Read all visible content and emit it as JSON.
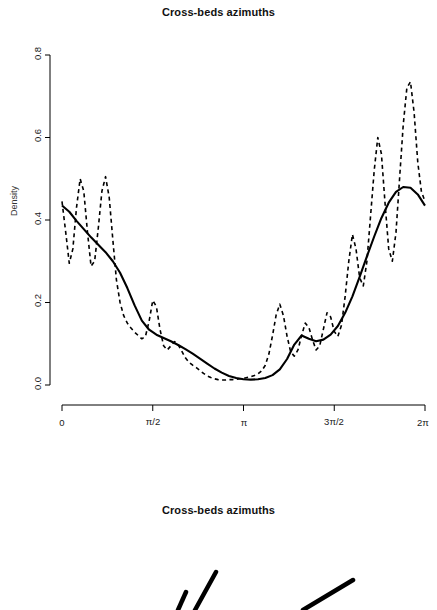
{
  "panels": [
    {
      "title": "Cross-beds azimuths"
    },
    {
      "title": "Cross-beds azimuths"
    }
  ],
  "chart_data": {
    "type": "line",
    "title": "Cross-beds azimuths",
    "xlabel": "",
    "ylabel": "Density",
    "xlim": [
      0,
      6.283185307179586
    ],
    "ylim": [
      0,
      0.8
    ],
    "grid": false,
    "legend": "none",
    "xticks": [
      0,
      1.5707963,
      3.1415927,
      4.712389,
      6.2831853
    ],
    "xticklabels": [
      "0",
      "π/2",
      "π",
      "3π/2",
      "2π"
    ],
    "yticks": [
      0.0,
      0.2,
      0.4,
      0.6,
      0.8
    ],
    "yticklabels": [
      "0.0",
      "0.2",
      "0.4",
      "0.6",
      "0.8"
    ],
    "series": [
      {
        "name": "smooth-density",
        "style": "solid",
        "color": "#000000",
        "x": [
          0.0,
          0.126,
          0.251,
          0.377,
          0.503,
          0.628,
          0.754,
          0.88,
          1.005,
          1.131,
          1.257,
          1.382,
          1.508,
          1.634,
          1.759,
          1.885,
          2.011,
          2.136,
          2.262,
          2.388,
          2.513,
          2.639,
          2.765,
          2.89,
          3.016,
          3.142,
          3.267,
          3.393,
          3.519,
          3.644,
          3.77,
          3.896,
          4.021,
          4.147,
          4.273,
          4.398,
          4.524,
          4.65,
          4.775,
          4.901,
          5.027,
          5.152,
          5.278,
          5.404,
          5.529,
          5.655,
          5.781,
          5.906,
          6.032,
          6.158,
          6.283
        ],
        "y": [
          0.435,
          0.42,
          0.398,
          0.378,
          0.358,
          0.34,
          0.322,
          0.3,
          0.272,
          0.235,
          0.193,
          0.156,
          0.134,
          0.122,
          0.114,
          0.106,
          0.097,
          0.087,
          0.076,
          0.064,
          0.052,
          0.04,
          0.03,
          0.022,
          0.017,
          0.014,
          0.013,
          0.014,
          0.017,
          0.024,
          0.038,
          0.063,
          0.098,
          0.12,
          0.112,
          0.106,
          0.11,
          0.122,
          0.143,
          0.175,
          0.215,
          0.262,
          0.312,
          0.36,
          0.405,
          0.442,
          0.468,
          0.48,
          0.478,
          0.462,
          0.435
        ]
      },
      {
        "name": "kernel-density-oscillating",
        "style": "dashed",
        "color": "#000000",
        "x": [
          0.0,
          0.063,
          0.126,
          0.188,
          0.251,
          0.314,
          0.377,
          0.44,
          0.503,
          0.565,
          0.628,
          0.691,
          0.754,
          0.817,
          0.88,
          0.942,
          1.005,
          1.068,
          1.131,
          1.194,
          1.257,
          1.319,
          1.382,
          1.445,
          1.508,
          1.571,
          1.634,
          1.696,
          1.759,
          1.822,
          1.885,
          1.948,
          2.011,
          2.073,
          2.136,
          2.199,
          2.262,
          2.325,
          2.388,
          2.45,
          2.513,
          2.576,
          2.639,
          2.702,
          2.765,
          2.827,
          2.89,
          2.953,
          3.016,
          3.079,
          3.142,
          3.204,
          3.267,
          3.33,
          3.393,
          3.456,
          3.519,
          3.581,
          3.644,
          3.707,
          3.77,
          3.833,
          3.896,
          3.958,
          4.021,
          4.084,
          4.147,
          4.21,
          4.273,
          4.335,
          4.398,
          4.461,
          4.524,
          4.587,
          4.65,
          4.712,
          4.775,
          4.838,
          4.901,
          4.964,
          5.027,
          5.089,
          5.152,
          5.215,
          5.278,
          5.341,
          5.404,
          5.466,
          5.529,
          5.592,
          5.655,
          5.718,
          5.781,
          5.843,
          5.906,
          5.969,
          6.032,
          6.095,
          6.158,
          6.22,
          6.283
        ],
        "y": [
          0.445,
          0.372,
          0.295,
          0.33,
          0.43,
          0.5,
          0.47,
          0.372,
          0.288,
          0.3,
          0.38,
          0.47,
          0.505,
          0.455,
          0.352,
          0.255,
          0.2,
          0.168,
          0.15,
          0.138,
          0.128,
          0.12,
          0.112,
          0.118,
          0.155,
          0.205,
          0.19,
          0.135,
          0.095,
          0.085,
          0.095,
          0.105,
          0.098,
          0.082,
          0.066,
          0.055,
          0.048,
          0.042,
          0.035,
          0.028,
          0.022,
          0.018,
          0.015,
          0.013,
          0.012,
          0.012,
          0.013,
          0.013,
          0.014,
          0.015,
          0.016,
          0.018,
          0.02,
          0.023,
          0.027,
          0.034,
          0.048,
          0.075,
          0.12,
          0.17,
          0.196,
          0.168,
          0.118,
          0.08,
          0.07,
          0.085,
          0.12,
          0.15,
          0.14,
          0.11,
          0.085,
          0.095,
          0.135,
          0.175,
          0.165,
          0.13,
          0.118,
          0.145,
          0.215,
          0.3,
          0.365,
          0.33,
          0.26,
          0.24,
          0.3,
          0.41,
          0.52,
          0.6,
          0.56,
          0.44,
          0.33,
          0.3,
          0.37,
          0.5,
          0.63,
          0.72,
          0.735,
          0.66,
          0.54,
          0.47,
          0.445
        ]
      }
    ]
  },
  "rose": {
    "name": "rose-diagram",
    "spokes": [
      {
        "x1": 178,
        "y1": 610,
        "x2": 186,
        "y2": 592
      },
      {
        "x1": 195,
        "y1": 610,
        "x2": 216,
        "y2": 572
      },
      {
        "x1": 303,
        "y1": 610,
        "x2": 353,
        "y2": 580
      }
    ]
  }
}
